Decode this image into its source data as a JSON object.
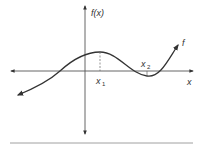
{
  "diagram": {
    "type": "function-graph",
    "labels": {
      "y_axis": "f(x)",
      "x_axis": "x",
      "curve": "f",
      "x1_base": "x",
      "x1_sub": "1",
      "x2_base": "x",
      "x2_sub": "2"
    },
    "features": {
      "local_max_at": "x1",
      "local_min_at": "x2",
      "dashed_drop_from_max": true
    },
    "colors": {
      "axis": "#444444",
      "curve": "#333333",
      "rule": "#888888"
    }
  }
}
